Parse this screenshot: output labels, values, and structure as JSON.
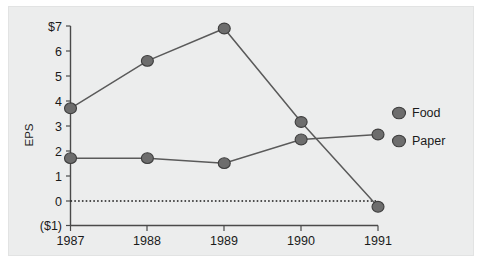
{
  "chart_data": {
    "type": "line",
    "title": "",
    "xlabel": "",
    "ylabel": "EPS",
    "categories": [
      "1987",
      "1988",
      "1989",
      "1990",
      "1991"
    ],
    "ylim": [
      -1,
      7
    ],
    "y_ticks": [
      -1,
      0,
      1,
      2,
      3,
      4,
      5,
      6,
      7
    ],
    "y_tick_labels": [
      "($1)",
      "0",
      "1",
      "2",
      "3",
      "4",
      "5",
      "6",
      "$7"
    ],
    "grid": false,
    "legend_position": "right",
    "zero_reference_line": true,
    "series": [
      {
        "name": "Food",
        "values": [
          3.7,
          5.6,
          6.9,
          3.15,
          -0.25
        ]
      },
      {
        "name": "Paper",
        "values": [
          1.7,
          1.7,
          1.5,
          2.45,
          2.65
        ]
      }
    ]
  },
  "legend": {
    "items": [
      {
        "label": "Food"
      },
      {
        "label": "Paper"
      }
    ]
  },
  "axis": {
    "y_title": "EPS"
  },
  "colors": {
    "marker_fill": "#6d6d6d",
    "marker_stroke": "#3d3d3d",
    "line": "#5a5a5a",
    "axis": "#4a4a4a",
    "plot_background": "#eceded",
    "text": "#1a1a1a"
  }
}
